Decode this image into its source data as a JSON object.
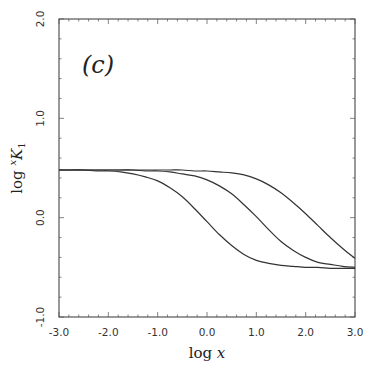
{
  "chart_data": {
    "type": "line",
    "title": "",
    "panel_label": "(c)",
    "xlabel": "log x",
    "ylabel": "log xK1",
    "ylabel_parts": {
      "prefix": "log ",
      "sup": "x",
      "main": "K",
      "sub": "1"
    },
    "xlim": [
      -3.0,
      3.0
    ],
    "ylim": [
      -1.0,
      2.0
    ],
    "xticks": [
      -3.0,
      -2.0,
      -1.0,
      0.0,
      1.0,
      2.0,
      3.0
    ],
    "xtick_labels": [
      "-3.0",
      "-2.0",
      "-1.0",
      "0.0",
      "1.0",
      "2.0",
      "3.0"
    ],
    "yticks": [
      -1.0,
      0.0,
      1.0,
      2.0
    ],
    "ytick_labels": [
      "-1.0",
      "0.0",
      "1.0",
      "2.0"
    ],
    "minor_tick_step": 0.2,
    "grid": false,
    "legend": null,
    "x": [
      -3.0,
      -2.75,
      -2.5,
      -2.25,
      -2.0,
      -1.75,
      -1.5,
      -1.25,
      -1.0,
      -0.75,
      -0.5,
      -0.25,
      0.0,
      0.25,
      0.5,
      0.75,
      1.0,
      1.25,
      1.5,
      1.75,
      2.0,
      2.25,
      2.5,
      2.75,
      3.0
    ],
    "series": [
      {
        "name": "curve 1",
        "values": [
          0.48,
          0.48,
          0.48,
          0.47,
          0.47,
          0.46,
          0.44,
          0.41,
          0.37,
          0.3,
          0.21,
          0.09,
          -0.04,
          -0.17,
          -0.28,
          -0.37,
          -0.43,
          -0.46,
          -0.48,
          -0.49,
          -0.5,
          -0.5,
          -0.51,
          -0.51,
          -0.51
        ]
      },
      {
        "name": "curve 2",
        "values": [
          0.48,
          0.48,
          0.48,
          0.48,
          0.48,
          0.48,
          0.48,
          0.47,
          0.47,
          0.46,
          0.44,
          0.42,
          0.38,
          0.32,
          0.24,
          0.13,
          0.01,
          -0.12,
          -0.24,
          -0.33,
          -0.4,
          -0.45,
          -0.47,
          -0.49,
          -0.5
        ]
      },
      {
        "name": "curve 3",
        "values": [
          0.48,
          0.48,
          0.48,
          0.48,
          0.48,
          0.48,
          0.48,
          0.48,
          0.48,
          0.48,
          0.48,
          0.47,
          0.47,
          0.46,
          0.45,
          0.43,
          0.39,
          0.33,
          0.25,
          0.15,
          0.04,
          -0.08,
          -0.2,
          -0.31,
          -0.41
        ]
      }
    ],
    "line_color": "#333333"
  }
}
